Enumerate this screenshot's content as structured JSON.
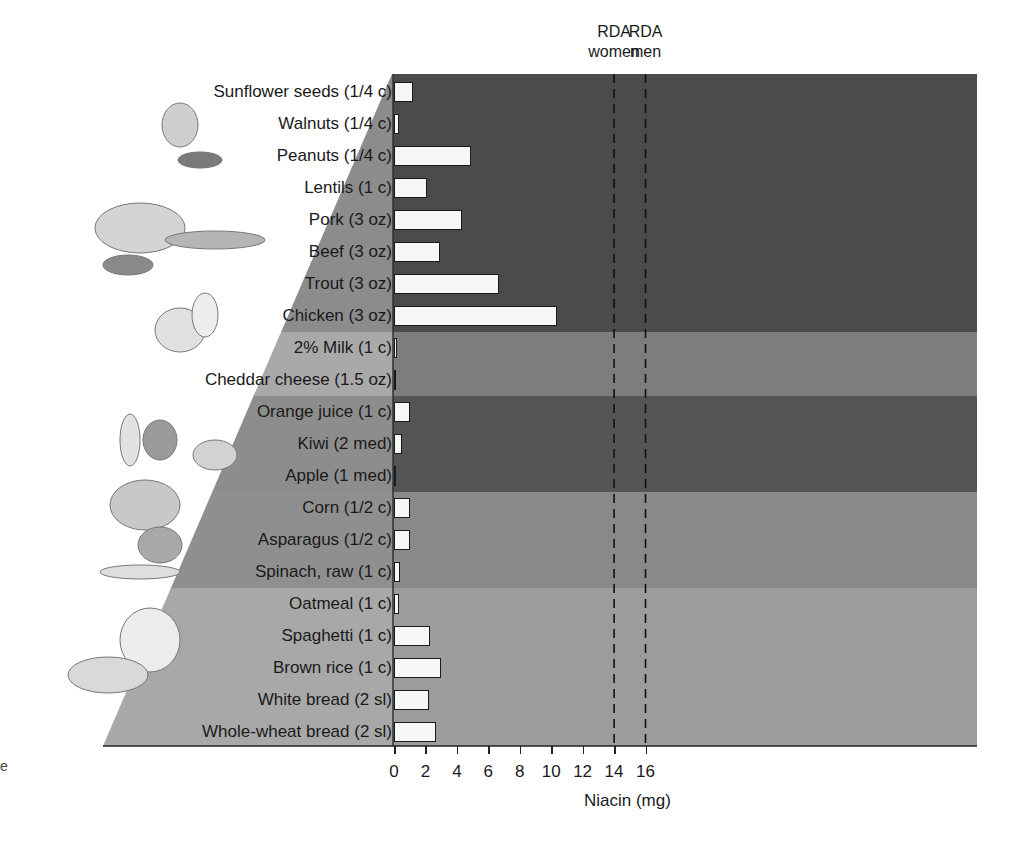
{
  "chart_data": {
    "type": "bar",
    "orientation": "horizontal",
    "title": "",
    "xlabel": "Niacin (mg)",
    "ylabel": "",
    "xlim": [
      0,
      18.5
    ],
    "xticks": [
      0,
      2,
      4,
      6,
      8,
      10,
      12,
      14,
      16
    ],
    "grid": false,
    "categories": [
      "Sunflower seeds (1/4 c)",
      "Walnuts (1/4 c)",
      "Peanuts (1/4 c)",
      "Lentils (1 c)",
      "Pork (3 oz)",
      "Beef (3 oz)",
      "Trout (3 oz)",
      "Chicken (3 oz)",
      "2% Milk (1 c)",
      "Cheddar cheese (1.5 oz)",
      "Orange juice (1 c)",
      "Kiwi (2 med)",
      "Apple (1 med)",
      "Corn (1/2 c)",
      "Asparagus (1/2 c)",
      "Spinach, raw (1 c)",
      "Oatmeal (1 c)",
      "Spaghetti (1 c)",
      "Brown rice (1 c)",
      "White bread (2 sl)",
      "Whole-wheat bread (2 sl)"
    ],
    "values": [
      1.2,
      0.3,
      4.9,
      2.1,
      4.3,
      2.9,
      6.7,
      10.4,
      0.2,
      0.0,
      1.0,
      0.5,
      0.1,
      1.0,
      1.0,
      0.4,
      0.3,
      2.3,
      3.0,
      2.2,
      2.7
    ],
    "groups": [
      {
        "name": "Meat and beans",
        "rows": [
          0,
          7
        ],
        "color": "#4b4b4b",
        "label_color": "#8c8c8c"
      },
      {
        "name": "Milk",
        "rows": [
          8,
          9
        ],
        "color": "#7d7d7d",
        "label_color": "#a9a9a9"
      },
      {
        "name": "Fruits",
        "rows": [
          10,
          12
        ],
        "color": "#555555",
        "label_color": "#8d8d8d"
      },
      {
        "name": "Vegetables",
        "rows": [
          13,
          15
        ],
        "color": "#898989",
        "label_color": "#8f8f8f"
      },
      {
        "name": "Grains",
        "rows": [
          16,
          20
        ],
        "color": "#9c9c9c",
        "label_color": "#a8a8a8"
      }
    ],
    "reference_lines": [
      {
        "x": 14,
        "label_line1": "RDA",
        "label_line2": "women",
        "style": "dashed"
      },
      {
        "x": 16,
        "label_line1": "RDA",
        "label_line2": "men",
        "style": "dashed"
      }
    ],
    "bar_color": "#f7f7f5"
  },
  "illustrations": [
    "nuts-seeds-icon",
    "meat-fish-icon",
    "cheese-milk-icon",
    "fruit-icon",
    "vegetables-icon",
    "grains-bread-icon"
  ],
  "stray_text": "e"
}
